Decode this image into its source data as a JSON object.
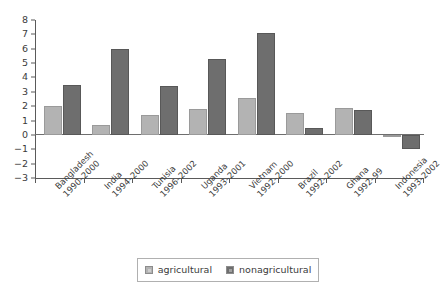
{
  "chart_data": {
    "type": "bar",
    "title": "",
    "subtitle": "",
    "xlabel": "",
    "ylabel": "",
    "ylim": [
      -3,
      8
    ],
    "ytick_step": 1,
    "yticks": [
      "8",
      "7",
      "6",
      "5",
      "4",
      "3",
      "2",
      "1",
      "0",
      "-1",
      "-2",
      "-3"
    ],
    "grid": false,
    "legend_position": "bottom",
    "categories": [
      "Bangladesh 1990-2000",
      "India 1994-2000",
      "Tunisia 1996-2002",
      "Uganda 1993-2001",
      "Vietnam 1992-2000",
      "Brazil 1992-2002",
      "Ghana 1992-99",
      "Indonesia 1993-2002"
    ],
    "category_parts": [
      {
        "country": "Bangladesh",
        "period": "1990–2000"
      },
      {
        "country": "India",
        "period": "1994–2000"
      },
      {
        "country": "Tunisia",
        "period": "1996–2002"
      },
      {
        "country": "Uganda",
        "period": "1993–2001"
      },
      {
        "country": "Vietnam",
        "period": "1992–2000"
      },
      {
        "country": "Brazil",
        "period": "1992–2002"
      },
      {
        "country": "Ghana",
        "period": "1992–99"
      },
      {
        "country": "Indonesia",
        "period": "1993–2002"
      }
    ],
    "series": [
      {
        "name": "agricultural",
        "color": "#b3b3b3",
        "values": [
          2.0,
          0.7,
          1.4,
          1.8,
          2.6,
          1.5,
          1.9,
          -0.1
        ]
      },
      {
        "name": "nonagricultural",
        "color": "#6e6e6e",
        "values": [
          3.5,
          6.0,
          3.4,
          5.3,
          7.1,
          0.5,
          1.7,
          -1.0
        ]
      }
    ]
  },
  "legend": {
    "items": [
      {
        "label": "agricultural",
        "color": "#b3b3b3"
      },
      {
        "label": "nonagricultural",
        "color": "#6e6e6e"
      }
    ]
  }
}
